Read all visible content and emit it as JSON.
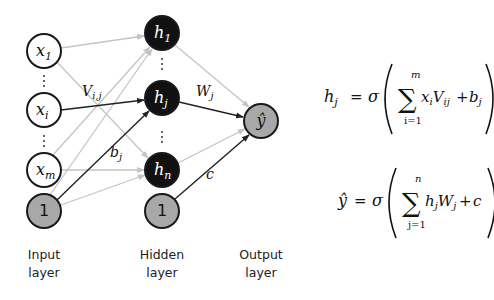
{
  "diagram": {
    "input_nodes": [
      {
        "id": "x1",
        "base": "x",
        "sub": "1",
        "cx": 44,
        "cy": 51
      },
      {
        "id": "xi",
        "base": "x",
        "sub": "i",
        "cx": 44,
        "cy": 110
      },
      {
        "id": "xm",
        "base": "x",
        "sub": "m",
        "cx": 44,
        "cy": 170
      }
    ],
    "input_bias": {
      "label": "1",
      "cx": 44,
      "cy": 211
    },
    "hidden_nodes": [
      {
        "id": "h1",
        "base": "h",
        "sub": "1",
        "cx": 162,
        "cy": 33
      },
      {
        "id": "hj",
        "base": "h",
        "sub": "j",
        "cx": 162,
        "cy": 98
      },
      {
        "id": "hn",
        "base": "h",
        "sub": "n",
        "cx": 162,
        "cy": 170
      }
    ],
    "hidden_bias": {
      "label": "1",
      "cx": 162,
      "cy": 211
    },
    "output_node": {
      "label": "ŷ",
      "cx": 261,
      "cy": 121
    },
    "edge_labels": {
      "v_ij": "V",
      "v_ij_sub": "i,j",
      "b_j": "b",
      "b_j_sub": "j",
      "w_j": "W",
      "w_j_sub": "j",
      "c": "c"
    },
    "layer_labels": {
      "input": [
        "Input",
        "layer"
      ],
      "hidden": [
        "Hidden",
        "layer"
      ],
      "output": [
        "Output",
        "layer"
      ]
    },
    "colors": {
      "hidden_fill": "#111111",
      "bias_fill": "#a8a8a8",
      "output_fill": "#a8a8a8",
      "input_fill": "#ffffff",
      "highlight_edge": "#222222",
      "faded_edge": "#c4c4c4"
    }
  },
  "equations": {
    "hidden": {
      "lhs": "h",
      "lhs_sub": "j",
      "equals": "=",
      "sigma": "σ",
      "sum_upper": "m",
      "sum_lower": "i=1",
      "term1": "x",
      "term1_sub": "i",
      "term2": "V",
      "term2_sub": "ij",
      "plus": "+",
      "bias": "b",
      "bias_sub": "j"
    },
    "output": {
      "lhs": "ŷ",
      "equals": "=",
      "sigma": "σ",
      "sum_upper": "n",
      "sum_lower": "j=1",
      "term1": "h",
      "term1_sub": "j",
      "term2": "W",
      "term2_sub": "j",
      "plus": "+",
      "bias": "c"
    }
  }
}
